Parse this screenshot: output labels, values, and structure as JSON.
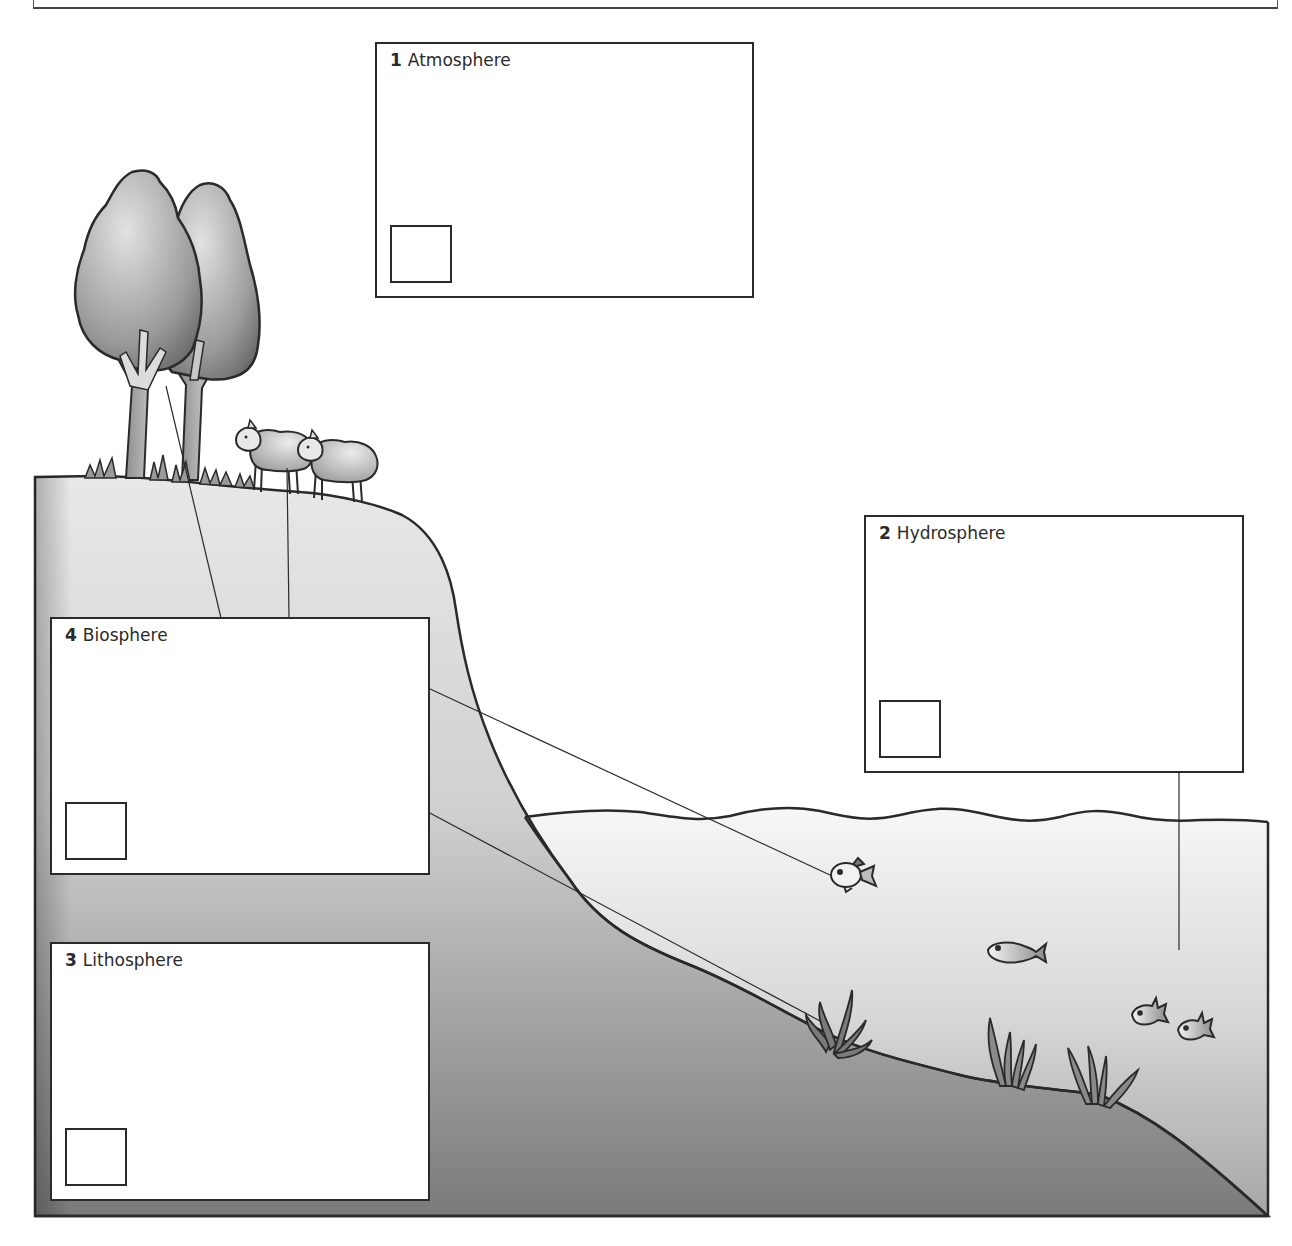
{
  "diagram": {
    "boxes": [
      {
        "number": "1",
        "label": "Atmosphere"
      },
      {
        "number": "2",
        "label": "Hydrosphere"
      },
      {
        "number": "3",
        "label": "Lithosphere"
      },
      {
        "number": "4",
        "label": "Biosphere"
      }
    ],
    "illustration": {
      "elements": [
        "tree",
        "tree",
        "sheep",
        "sheep",
        "grass",
        "fish",
        "fish",
        "fish",
        "fish",
        "seaweed",
        "seaweed",
        "seaweed"
      ],
      "colors": {
        "outline": "#2a2a2a",
        "land_light": "#e4e4e4",
        "land_dark": "#6e6e6e",
        "water_light": "#f4f4f4",
        "water_dark": "#a8a8a8"
      }
    }
  }
}
